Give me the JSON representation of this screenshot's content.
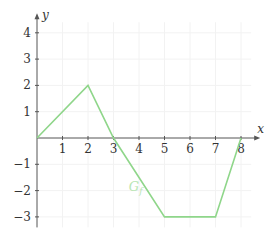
{
  "chart_data": {
    "type": "line",
    "title": "",
    "xlabel": "x",
    "ylabel": "y",
    "xlim": [
      0,
      8.4
    ],
    "ylim": [
      -3.4,
      4.4
    ],
    "grid": true,
    "x_ticks": [
      1,
      2,
      3,
      4,
      5,
      6,
      7,
      8
    ],
    "y_ticks": [
      -3,
      -2,
      -1,
      1,
      2,
      3,
      4
    ],
    "series": [
      {
        "name": "G_f",
        "label_text": "G",
        "label_sub": "f",
        "color": "#8fd68a",
        "x": [
          0,
          2,
          3,
          5,
          7,
          8
        ],
        "y": [
          0,
          2,
          0,
          -3,
          -3,
          0
        ]
      }
    ],
    "annotations": [
      {
        "text": "G_f",
        "x": 3.6,
        "y": -2.0
      }
    ]
  },
  "colors": {
    "axis": "#555555",
    "grid": "#f2f2f2",
    "curve": "#8fd68a",
    "label": "#b9e6b4"
  }
}
